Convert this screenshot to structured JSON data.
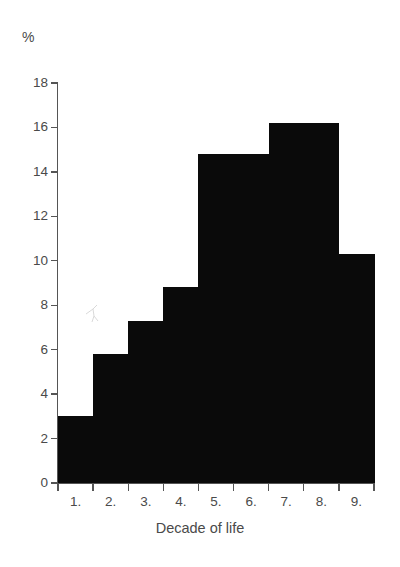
{
  "chart_data": {
    "type": "bar",
    "title": "",
    "subtitle": "",
    "xlabel": "Decade of life",
    "ylabel": "%",
    "unit_label": "%",
    "categories": [
      "1.",
      "2.",
      "3.",
      "4.",
      "5.",
      "6.",
      "7.",
      "8.",
      "9."
    ],
    "values": [
      3.0,
      5.8,
      7.3,
      8.8,
      14.8,
      14.8,
      16.2,
      16.2,
      10.3
    ],
    "series": [
      {
        "name": "Share of cases",
        "values": [
          3.0,
          5.8,
          7.3,
          8.8,
          14.8,
          14.8,
          16.2,
          16.2,
          10.3
        ]
      }
    ],
    "ylim": [
      0,
      18
    ],
    "xlim": [
      0,
      9
    ],
    "yticks": [
      0,
      2,
      4,
      6,
      8,
      10,
      12,
      14,
      16,
      18
    ],
    "ytick_labels": [
      "0",
      "2",
      "4",
      "6",
      "8",
      "10",
      "12",
      "14",
      "16",
      "18"
    ],
    "xtick_labels": [
      "1.",
      "2.",
      "3.",
      "4.",
      "5.",
      "6.",
      "7.",
      "8.",
      "9."
    ],
    "grid": false,
    "legend": null,
    "legend_position": "none",
    "annotations": [],
    "bar_color": "#0a0a0a",
    "axis_color": "#555555",
    "text_color": "#4a4a4a",
    "background_color": "#ffffff"
  },
  "axes": {
    "y_unit": "%",
    "x_title": "Decade of life"
  }
}
